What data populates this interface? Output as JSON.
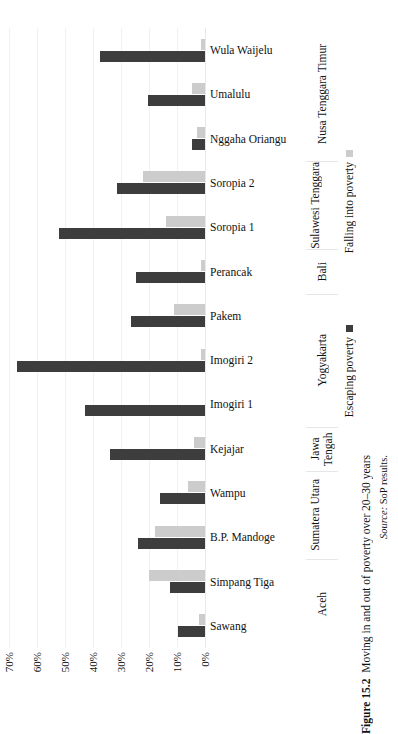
{
  "figure": {
    "number": "Figure 15.2",
    "title": "Moving in and out of poverty over 20–30 years",
    "source_label": "Source:",
    "source_text": " SoP results."
  },
  "legend": {
    "position": "right",
    "items": [
      {
        "label": "Falling into poverty",
        "color": "#cccccc",
        "key": "falling"
      },
      {
        "label": "Escaping poverty",
        "color": "#3d3d3d",
        "key": "escaping"
      }
    ]
  },
  "axis": {
    "tick_labels": [
      "70%",
      "60%",
      "50%",
      "40%",
      "30%",
      "20%",
      "10%",
      "0%"
    ],
    "tick_values": [
      70,
      60,
      50,
      40,
      30,
      20,
      10,
      0
    ],
    "min": 0,
    "max": 70,
    "grid": true
  },
  "regions": [
    {
      "name": "Nusa Tenggara Timur",
      "villages": [
        "Wula Waijelu",
        "Umalulu",
        "Nggaha Oriangu"
      ]
    },
    {
      "name": "Sulawesi Tenggara",
      "villages": [
        "Soropia 2",
        "Soropia 1"
      ]
    },
    {
      "name": "Bali",
      "villages": [
        "Perancak"
      ]
    },
    {
      "name": "Yogyakarta",
      "villages": [
        "Pakem",
        "Imogiri 2",
        "Imogiri 1"
      ]
    },
    {
      "name": "Jawa Tengah",
      "villages": [
        "Kejajar"
      ]
    },
    {
      "name": "Sumatera Utara",
      "villages": [
        "Wampu",
        "B.P. Mandoge"
      ]
    },
    {
      "name": "Aceh",
      "villages": [
        "Simpang Tiga",
        "Sawang"
      ]
    }
  ],
  "chart_data": {
    "type": "bar",
    "orientation": "horizontal",
    "title": "Moving in and out of poverty over 20–30 years",
    "xlabel": "",
    "ylabel": "",
    "xlim": [
      0,
      70
    ],
    "grid": true,
    "legend_position": "right",
    "categories": [
      "Wula Waijelu",
      "Umalulu",
      "Nggaha Oriangu",
      "Soropia 2",
      "Soropia 1",
      "Perancak",
      "Pakem",
      "Imogiri 2",
      "Imogiri 1",
      "Kejajar",
      "Wampu",
      "B.P. Mandoge",
      "Simpang Tiga",
      "Sawang"
    ],
    "series": [
      {
        "name": "Escaping poverty",
        "color": "#3d3d3d",
        "values": [
          37.5,
          20.5,
          4.5,
          31.5,
          52.0,
          24.5,
          26.5,
          67.0,
          43.0,
          34.0,
          16.0,
          24.0,
          12.5,
          9.5
        ]
      },
      {
        "name": "Falling into poverty",
        "color": "#cccccc",
        "values": [
          1.5,
          4.5,
          3.0,
          22.0,
          14.0,
          1.5,
          11.0,
          1.5,
          0.0,
          4.0,
          6.0,
          18.0,
          20.0,
          2.0
        ]
      }
    ]
  }
}
